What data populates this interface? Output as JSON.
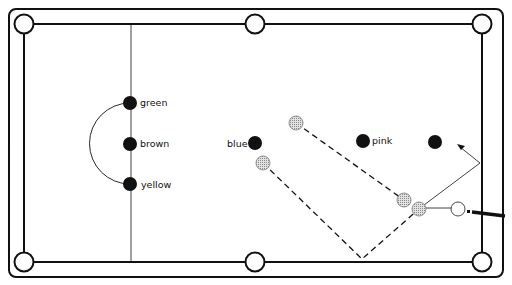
{
  "diagram": {
    "type": "snooker-table-shot-diagram",
    "colors": {
      "line": "#111111",
      "object_ball": "#111111",
      "ghost_ball_fill": "#c8c8c8",
      "cue_ball_fill": "#ffffff"
    },
    "balls": [
      {
        "id": "green",
        "label": "green",
        "x": 130,
        "y": 103
      },
      {
        "id": "brown",
        "label": "brown",
        "x": 130,
        "y": 144
      },
      {
        "id": "yellow",
        "label": "yellow",
        "x": 130,
        "y": 184
      },
      {
        "id": "blue",
        "label": "blue",
        "x": 255,
        "y": 143
      },
      {
        "id": "pink",
        "label": "pink",
        "x": 363,
        "y": 141
      },
      {
        "id": "black",
        "label": "",
        "x": 435,
        "y": 142
      }
    ],
    "labels": {
      "green": "green",
      "brown": "brown",
      "yellow": "yellow",
      "blue": "blue",
      "pink": "pink"
    },
    "ghost_balls": [
      {
        "x": 296,
        "y": 123
      },
      {
        "x": 263,
        "y": 163
      },
      {
        "x": 404,
        "y": 200
      },
      {
        "x": 419,
        "y": 209
      }
    ],
    "cue_ball": {
      "x": 458,
      "y": 209
    },
    "pockets": [
      {
        "name": "top-left",
        "x": 24,
        "y": 24
      },
      {
        "name": "top-middle",
        "x": 255,
        "y": 24
      },
      {
        "name": "top-right",
        "x": 482,
        "y": 24
      },
      {
        "name": "bottom-left",
        "x": 24,
        "y": 262
      },
      {
        "name": "bottom-middle",
        "x": 255,
        "y": 262
      },
      {
        "name": "bottom-right",
        "x": 482,
        "y": 262
      }
    ],
    "paths": {
      "upper_dashed": {
        "from": [
          296,
          123
        ],
        "to": [
          404,
          200
        ]
      },
      "lower_dashed": [
        [
          263,
          163
        ],
        [
          362,
          259
        ],
        [
          419,
          209
        ]
      ],
      "cue_line": {
        "from": [
          458,
          209
        ],
        "to": [
          419,
          209
        ]
      },
      "cue_ball_deflection": {
        "from": [
          419,
          209
        ],
        "to": [
          480,
          163
        ],
        "then_arrow_to": [
          458,
          145
        ]
      }
    }
  }
}
